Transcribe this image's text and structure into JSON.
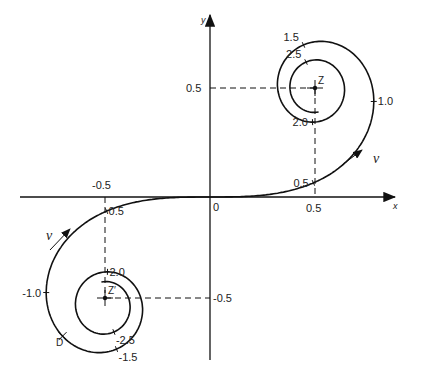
{
  "diagram": {
    "type": "cornu-spiral",
    "axes": {
      "x_label": "x",
      "y_label": "y",
      "origin_label": "0",
      "x_ticks": [
        {
          "value": 0.5,
          "label": "0.5"
        },
        {
          "value": -0.5,
          "label": "-0.5"
        }
      ],
      "y_ticks": [
        {
          "value": 0.5,
          "label": "0.5"
        },
        {
          "value": -0.5,
          "label": "-0.5"
        }
      ]
    },
    "points": {
      "Z": {
        "label": "Z",
        "x": 0.5,
        "y": 0.5
      },
      "Z_prime": {
        "label": "Z′",
        "x": -0.5,
        "y": -0.5
      },
      "D": {
        "label": "D"
      }
    },
    "direction_label": "v",
    "arc_length_marks_upper": [
      {
        "t": 0.5,
        "label": "0.5"
      },
      {
        "t": 1.0,
        "label": "1.0"
      },
      {
        "t": 1.5,
        "label": "1.5"
      },
      {
        "t": 2.0,
        "label": "2.0"
      },
      {
        "t": 2.5,
        "label": "2.5"
      }
    ],
    "arc_length_marks_lower": [
      {
        "t": -0.5,
        "label": "0.5"
      },
      {
        "t": -1.0,
        "label": "-1.0"
      },
      {
        "t": -1.5,
        "label": "-1.5"
      },
      {
        "t": -2.0,
        "label": "2.0"
      },
      {
        "t": -2.5,
        "label": "-2.5"
      }
    ],
    "t_range": [
      -2.85,
      2.85
    ]
  }
}
